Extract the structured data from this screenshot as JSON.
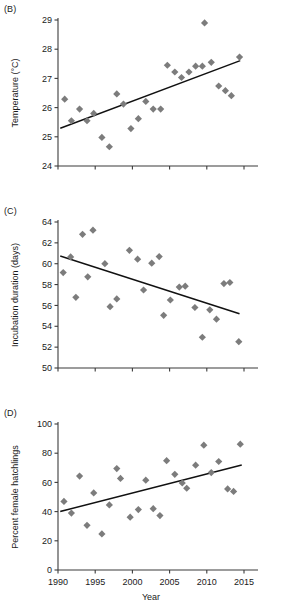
{
  "figure": {
    "xlabel": "Year",
    "marker_color": "#7c7c7c",
    "axis_color": "#3b3b3b",
    "line_color": "#111111"
  },
  "panels": {
    "B": {
      "label": "(B)",
      "ylabel": "Temperature (°C)",
      "yticks": [
        "24",
        "25",
        "26",
        "27",
        "28",
        "29"
      ],
      "xticks": [
        "",
        "",
        "",
        "",
        "",
        ""
      ],
      "show_xticklabels": false,
      "show_xlabel": false
    },
    "C": {
      "label": "(C)",
      "ylabel": "Incubation duration (days)",
      "yticks": [
        "50",
        "52",
        "54",
        "56",
        "58",
        "60",
        "62",
        "64"
      ],
      "xticks": [
        "",
        "",
        "",
        "",
        "",
        ""
      ],
      "show_xticklabels": false,
      "show_xlabel": false
    },
    "D": {
      "label": "(D)",
      "ylabel": "Percent female hatchlings",
      "yticks": [
        "0",
        "20",
        "40",
        "60",
        "80",
        "100"
      ],
      "xticks": [
        "1990",
        "1995",
        "2000",
        "2005",
        "2010",
        "2015"
      ],
      "show_xticklabels": true,
      "show_xlabel": true
    }
  },
  "chart_data": [
    {
      "panel": "B",
      "type": "scatter",
      "title": "(B)",
      "xlabel": "Year",
      "ylabel": "Temperature (°C)",
      "xlim": [
        1990,
        2015
      ],
      "ylim": [
        24,
        29
      ],
      "xticks": [
        1990,
        1995,
        2000,
        2005,
        2010,
        2015
      ],
      "yticks": [
        24,
        25,
        26,
        27,
        28,
        29
      ],
      "grid": false,
      "legend": "none",
      "points": [
        {
          "x": 1990.9,
          "y": 26.29
        },
        {
          "x": 1991.8,
          "y": 25.55
        },
        {
          "x": 1992.9,
          "y": 25.95
        },
        {
          "x": 1993.9,
          "y": 25.55
        },
        {
          "x": 1994.8,
          "y": 25.8
        },
        {
          "x": 1995.9,
          "y": 24.98
        },
        {
          "x": 1996.9,
          "y": 24.66
        },
        {
          "x": 1997.9,
          "y": 26.47
        },
        {
          "x": 1998.8,
          "y": 26.12
        },
        {
          "x": 1999.8,
          "y": 25.28
        },
        {
          "x": 2000.8,
          "y": 25.62
        },
        {
          "x": 2001.8,
          "y": 26.21
        },
        {
          "x": 2002.8,
          "y": 25.95
        },
        {
          "x": 2003.8,
          "y": 25.95
        },
        {
          "x": 2004.7,
          "y": 27.45
        },
        {
          "x": 2005.7,
          "y": 27.22
        },
        {
          "x": 2006.6,
          "y": 27.03
        },
        {
          "x": 2007.6,
          "y": 27.22
        },
        {
          "x": 2008.5,
          "y": 27.42
        },
        {
          "x": 2009.4,
          "y": 27.42
        },
        {
          "x": 2009.7,
          "y": 28.9
        },
        {
          "x": 2010.6,
          "y": 27.55
        },
        {
          "x": 2011.6,
          "y": 26.74
        },
        {
          "x": 2012.5,
          "y": 26.58
        },
        {
          "x": 2013.3,
          "y": 26.41
        },
        {
          "x": 2014.4,
          "y": 27.73
        }
      ],
      "trend": {
        "x0": 1990.4,
        "y0": 25.3,
        "x1": 2014.4,
        "y1": 27.6
      }
    },
    {
      "panel": "C",
      "type": "scatter",
      "title": "(C)",
      "xlabel": "Year",
      "ylabel": "Incubation duration (days)",
      "xlim": [
        1990,
        2015
      ],
      "ylim": [
        50,
        64
      ],
      "xticks": [
        1990,
        1995,
        2000,
        2005,
        2010,
        2015
      ],
      "yticks": [
        50,
        52,
        54,
        56,
        58,
        60,
        62,
        64
      ],
      "grid": false,
      "legend": "none",
      "points": [
        {
          "x": 1990.7,
          "y": 59.15
        },
        {
          "x": 1991.7,
          "y": 60.65
        },
        {
          "x": 1992.4,
          "y": 56.78
        },
        {
          "x": 1993.3,
          "y": 62.82
        },
        {
          "x": 1994.7,
          "y": 63.22
        },
        {
          "x": 1994.0,
          "y": 58.74
        },
        {
          "x": 1996.3,
          "y": 60.0
        },
        {
          "x": 1997.0,
          "y": 55.88
        },
        {
          "x": 1997.9,
          "y": 56.62
        },
        {
          "x": 1999.6,
          "y": 61.28
        },
        {
          "x": 2000.7,
          "y": 60.44
        },
        {
          "x": 2001.5,
          "y": 57.48
        },
        {
          "x": 2002.6,
          "y": 60.05
        },
        {
          "x": 2003.6,
          "y": 60.68
        },
        {
          "x": 2004.2,
          "y": 55.05
        },
        {
          "x": 2005.1,
          "y": 56.52
        },
        {
          "x": 2006.3,
          "y": 57.76
        },
        {
          "x": 2007.1,
          "y": 57.85
        },
        {
          "x": 2008.4,
          "y": 55.8
        },
        {
          "x": 2009.4,
          "y": 52.95
        },
        {
          "x": 2010.4,
          "y": 55.58
        },
        {
          "x": 2011.3,
          "y": 54.68
        },
        {
          "x": 2012.3,
          "y": 58.1
        },
        {
          "x": 2013.1,
          "y": 58.2
        },
        {
          "x": 2014.3,
          "y": 52.52
        }
      ],
      "trend": {
        "x0": 1990.4,
        "y0": 60.72,
        "x1": 2014.3,
        "y1": 55.22
      }
    },
    {
      "panel": "D",
      "type": "scatter",
      "title": "(D)",
      "xlabel": "Year",
      "ylabel": "Percent female hatchlings",
      "xlim": [
        1990,
        2015
      ],
      "ylim": [
        0,
        100
      ],
      "xticks": [
        1990,
        1995,
        2000,
        2005,
        2010,
        2015
      ],
      "yticks": [
        0,
        20,
        40,
        60,
        80,
        100
      ],
      "grid": false,
      "legend": "none",
      "points": [
        {
          "x": 1990.8,
          "y": 47.0
        },
        {
          "x": 1991.8,
          "y": 39.0
        },
        {
          "x": 1992.9,
          "y": 64.3
        },
        {
          "x": 1993.9,
          "y": 30.6
        },
        {
          "x": 1994.8,
          "y": 52.8
        },
        {
          "x": 1995.9,
          "y": 24.7
        },
        {
          "x": 1996.9,
          "y": 44.6
        },
        {
          "x": 1997.9,
          "y": 69.5
        },
        {
          "x": 1998.4,
          "y": 62.7
        },
        {
          "x": 1999.7,
          "y": 36.2
        },
        {
          "x": 2000.8,
          "y": 41.4
        },
        {
          "x": 2001.8,
          "y": 61.5
        },
        {
          "x": 2002.8,
          "y": 42.0
        },
        {
          "x": 2003.7,
          "y": 37.3
        },
        {
          "x": 2004.6,
          "y": 74.9
        },
        {
          "x": 2005.7,
          "y": 65.5
        },
        {
          "x": 2006.7,
          "y": 59.6
        },
        {
          "x": 2007.3,
          "y": 56.0
        },
        {
          "x": 2008.5,
          "y": 71.8
        },
        {
          "x": 2009.6,
          "y": 85.5
        },
        {
          "x": 2010.6,
          "y": 66.7
        },
        {
          "x": 2011.6,
          "y": 74.3
        },
        {
          "x": 2012.8,
          "y": 55.5
        },
        {
          "x": 2013.6,
          "y": 53.8
        },
        {
          "x": 2014.5,
          "y": 86.2
        }
      ],
      "trend": {
        "x0": 1990.4,
        "y0": 40.2,
        "x1": 2014.6,
        "y1": 71.8
      }
    }
  ]
}
